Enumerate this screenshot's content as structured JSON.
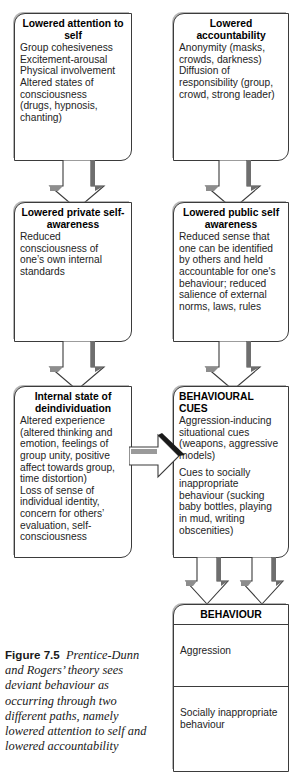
{
  "figure": {
    "label": "Figure 7.5",
    "caption": "Prentice-Dunn and Rogers’ theory sees deviant behaviour as occurring through two different paths, namely lowered attention to self and lowered accountability"
  },
  "boxes": {
    "lowered_attention": {
      "title": "Lowered attention\nto self",
      "body": "Group cohesiveness\nExcitement-arousal\nPhysical involvement\nAltered states of\nconsciousness\n(drugs, hypnosis,\nchanting)"
    },
    "lowered_accountability": {
      "title": "Lowered\naccountability",
      "body": "Anonymity (masks,\ncrowds, darkness)\nDiffusion of\nresponsibility (group,\ncrowd, strong leader)"
    },
    "lowered_private": {
      "title": "Lowered private\nself-awareness",
      "body": "Reduced\nconsciousness of\none’s own internal\nstandards"
    },
    "lowered_public": {
      "title": "Lowered public\nself awareness",
      "body": "Reduced sense that\none can be identified\nby others and held\naccountable for one's\nbehaviour; reduced\nsalience of external\nnorms, laws, rules"
    },
    "internal_state": {
      "title": "Internal state of\ndeindividuation",
      "body": "Altered experience\n(altered thinking and\nemotion, feelings of\ngroup unity, positive\naffect towards group,\ntime distortion)\nLoss of sense of\nindividual identity,\nconcern for others’\nevaluation, self-\nconsciousness"
    },
    "behavioural_cues": {
      "title": "BEHAVIOURAL CUES",
      "body_1": "Aggression-inducing\nsituational cues\n(weapons, aggressive\nmodels)",
      "body_2": "Cues to socially\ninappropriate\nbehaviour (sucking\nbaby bottles, playing\nin mud, writing\nobscenities)"
    },
    "behaviour": {
      "title": "BEHAVIOUR",
      "row_1": "Aggression",
      "row_2": "Socially inappropriate\nbehaviour"
    }
  },
  "colors": {
    "outline": "#3b3b3b",
    "shadow": "#787878",
    "arrow_fill": "#ffffff",
    "arrow_shadow_dark": "#1a1a1a",
    "text": "#242424"
  }
}
